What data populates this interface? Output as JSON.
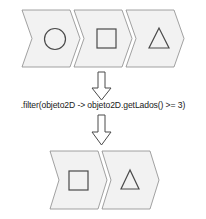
{
  "input_stream": {
    "items": [
      {
        "shape": "circle-icon",
        "sides": 0
      },
      {
        "shape": "square-icon",
        "sides": 4
      },
      {
        "shape": "triangle-icon",
        "sides": 3
      }
    ]
  },
  "arrows": [
    "down-arrow-icon",
    "down-arrow-icon"
  ],
  "operation": {
    "code": ".filter(objeto2D -> objeto2D.getLados() >= 3)"
  },
  "output_stream": {
    "items": [
      {
        "shape": "square-icon",
        "sides": 4
      },
      {
        "shape": "triangle-icon",
        "sides": 3
      }
    ]
  },
  "colors": {
    "chevron_fill": "#f2f2f2",
    "chevron_stroke": "#8a8a8a",
    "shape_stroke": "#4a4a4a"
  }
}
